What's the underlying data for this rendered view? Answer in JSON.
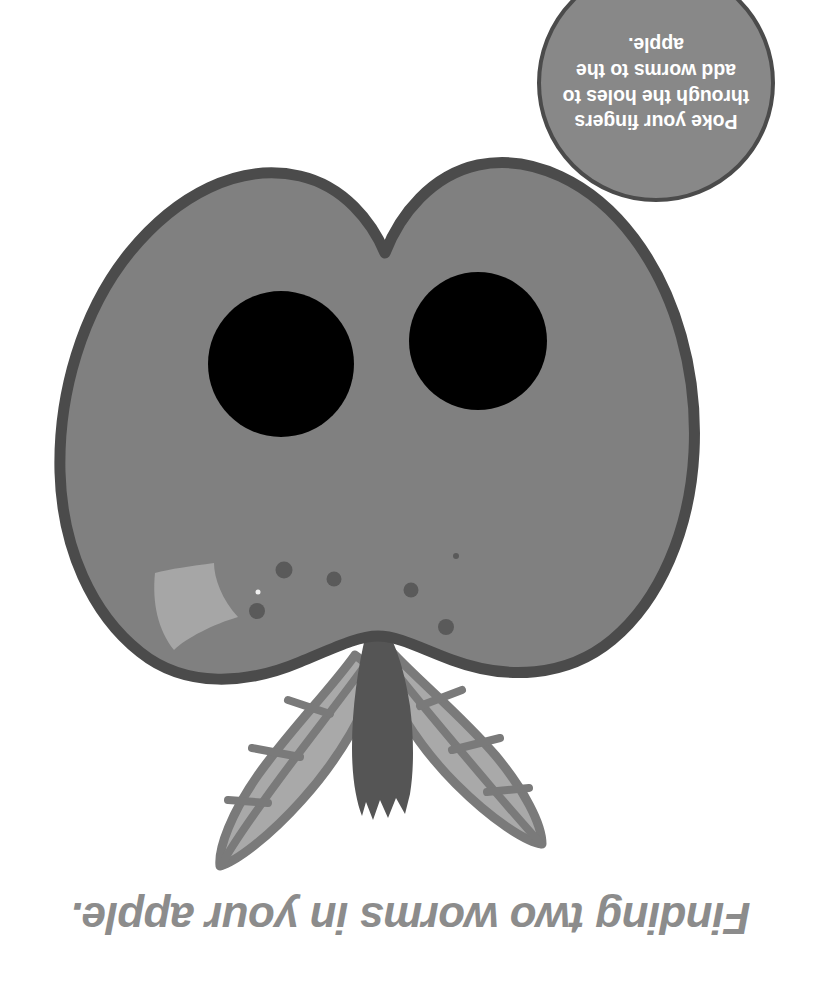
{
  "page": {
    "background_color": "#ffffff",
    "width": 821,
    "height": 986,
    "orientation_note": "upside-down"
  },
  "instruction_badge": {
    "icon": "circle-badge",
    "text": "Poke your fingers through the holes to add worms to the apple.",
    "lines": [
      "Poke your",
      "fingers through",
      "the holes to add",
      "worms to the",
      "apple."
    ],
    "fill_color": "#888888",
    "border_color": "#4b4b4b",
    "text_color": "#ffffff",
    "rotation_degrees": 180
  },
  "caption": {
    "text": "Finding two worms in your apple.",
    "color": "#8c8c8c",
    "rotation_degrees": 180,
    "style": "bold-italic"
  },
  "apple_illustration": {
    "name": "apple-with-finger-holes",
    "body_color": "#808080",
    "outline_color": "#4b4b4b",
    "highlight_color": "#a6a6a6",
    "hole_color": "#000000",
    "speckle_color": "#5a5a5a",
    "stem_color": "#555555",
    "leaf_fill_color": "#a9a9a9",
    "leaf_vein_color": "#7a7a7a",
    "holes": [
      {
        "label": "left-finger-hole",
        "cx": 281,
        "cy": 364,
        "r": 73
      },
      {
        "label": "right-finger-hole",
        "cx": 478,
        "cy": 341,
        "r": 69
      }
    ],
    "speckle_count": 6,
    "leaf_count": 2,
    "stem_count": 1
  }
}
